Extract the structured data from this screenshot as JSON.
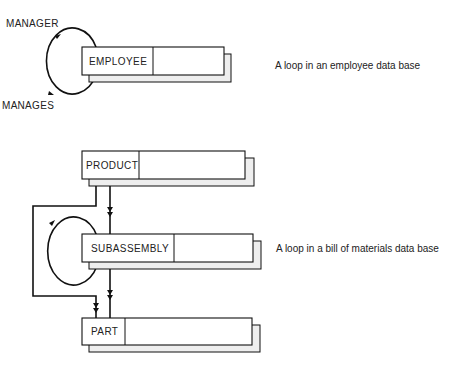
{
  "diagram": {
    "employee_loop": {
      "record": "EMPLOYEE",
      "relationship_labels": [
        "MANAGER",
        "MANAGES"
      ],
      "caption": "A loop in an employee data base"
    },
    "bom_loop": {
      "records": [
        "PRODUCT",
        "SUBASSEMBLY",
        "PART"
      ],
      "caption": "A loop in a bill of materials data base"
    }
  },
  "colors": {
    "line": "#111111",
    "box_fill": "#ffffff",
    "shadow_fill": "#eeeeee"
  }
}
